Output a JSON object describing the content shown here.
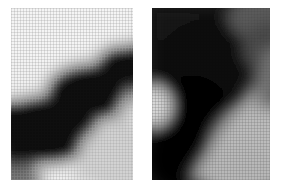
{
  "figure": {
    "background_color": "#ffffff",
    "canvas_width": 284,
    "canvas_height": 188,
    "panel_count": 2
  },
  "panels": [
    {
      "id": "panel-left",
      "name": "left-grayscale-panel",
      "x": 11,
      "y": 8,
      "width": 122,
      "height": 172,
      "grid_visible": true,
      "grid_spacing_px": 3,
      "grid_tone": "light",
      "overall_tone": "light background with dark diagonal band",
      "min_gray": "#050505",
      "max_gray": "#f4f4f4",
      "regions": [
        {
          "name": "upper-left-bright-field",
          "tone": "#ededed"
        },
        {
          "name": "diagonal-dark-band",
          "tone": "#0a0a0a"
        },
        {
          "name": "lower-right-midtone",
          "tone": "#c8c8c8"
        },
        {
          "name": "left-edge-gradient",
          "tone": "#9a9a9a"
        },
        {
          "name": "bottom-left-dark-lobe",
          "tone": "#141414"
        }
      ]
    },
    {
      "id": "panel-right",
      "name": "right-grayscale-panel",
      "x": 152,
      "y": 8,
      "width": 118,
      "height": 172,
      "grid_visible": true,
      "grid_spacing_px": 3,
      "grid_tone": "dark",
      "overall_tone": "dark upper field with light lower-right region",
      "min_gray": "#030303",
      "max_gray": "#d8d8d8",
      "regions": [
        {
          "name": "upper-dark-field",
          "tone": "#1a1a1a"
        },
        {
          "name": "left-edge-highlight",
          "tone": "#c4c4c4"
        },
        {
          "name": "central-black-mass",
          "tone": "#060606"
        },
        {
          "name": "lower-right-light-field",
          "tone": "#b0b0b0"
        },
        {
          "name": "right-edge-midtone",
          "tone": "#6a6a6a"
        }
      ]
    }
  ],
  "gap": {
    "name": "inter-panel-gap",
    "x": 133,
    "width": 19,
    "color": "#ffffff"
  },
  "chart_data": {
    "type": "heatmap",
    "title": "",
    "xlabel": "",
    "ylabel": "",
    "colormap": "grayscale",
    "value_range": [
      0,
      255
    ],
    "panels": [
      {
        "label": "left",
        "nx": 12,
        "ny": 17,
        "values": [
          [
            236,
            240,
            243,
            245,
            246,
            246,
            245,
            244,
            242,
            240,
            238,
            236
          ],
          [
            228,
            236,
            241,
            244,
            246,
            246,
            245,
            243,
            240,
            236,
            232,
            228
          ],
          [
            216,
            228,
            238,
            243,
            245,
            245,
            243,
            238,
            231,
            222,
            212,
            204
          ],
          [
            198,
            214,
            230,
            240,
            243,
            242,
            236,
            226,
            210,
            190,
            170,
            152
          ],
          [
            172,
            192,
            214,
            231,
            238,
            234,
            220,
            198,
            168,
            136,
            108,
            88
          ],
          [
            140,
            160,
            184,
            206,
            216,
            206,
            180,
            144,
            104,
            70,
            48,
            36
          ],
          [
            104,
            120,
            142,
            160,
            164,
            148,
            116,
            76,
            44,
            24,
            14,
            10
          ],
          [
            72,
            82,
            94,
            100,
            96,
            80,
            56,
            32,
            16,
            9,
            6,
            5
          ],
          [
            44,
            48,
            52,
            52,
            46,
            36,
            24,
            14,
            8,
            5,
            5,
            6
          ],
          [
            26,
            26,
            26,
            24,
            20,
            16,
            11,
            8,
            6,
            6,
            8,
            14
          ],
          [
            16,
            15,
            14,
            13,
            11,
            9,
            8,
            7,
            8,
            12,
            24,
            48
          ],
          [
            12,
            11,
            10,
            10,
            9,
            9,
            9,
            12,
            22,
            44,
            80,
            120
          ],
          [
            11,
            10,
            10,
            10,
            11,
            13,
            20,
            36,
            66,
            104,
            142,
            172
          ],
          [
            12,
            12,
            13,
            16,
            22,
            34,
            56,
            88,
            124,
            156,
            180,
            196
          ],
          [
            18,
            22,
            30,
            44,
            64,
            92,
            124,
            152,
            176,
            194,
            206,
            214
          ],
          [
            40,
            54,
            76,
            102,
            128,
            152,
            172,
            188,
            200,
            210,
            216,
            220
          ],
          [
            84,
            104,
            128,
            150,
            168,
            182,
            194,
            202,
            210,
            216,
            220,
            222
          ]
        ]
      },
      {
        "label": "right",
        "nx": 12,
        "ny": 17,
        "values": [
          [
            44,
            36,
            30,
            26,
            24,
            24,
            26,
            30,
            36,
            48,
            66,
            86
          ],
          [
            40,
            32,
            26,
            22,
            20,
            20,
            22,
            28,
            38,
            54,
            76,
            98
          ],
          [
            36,
            28,
            22,
            18,
            16,
            16,
            20,
            28,
            42,
            64,
            92,
            116
          ],
          [
            36,
            28,
            20,
            16,
            14,
            14,
            18,
            28,
            48,
            76,
            108,
            132
          ],
          [
            44,
            32,
            22,
            16,
            12,
            12,
            16,
            28,
            52,
            84,
            118,
            142
          ],
          [
            64,
            44,
            26,
            16,
            11,
            10,
            14,
            26,
            52,
            88,
            124,
            148
          ],
          [
            100,
            68,
            36,
            18,
            10,
            8,
            11,
            22,
            48,
            86,
            124,
            150
          ],
          [
            140,
            98,
            50,
            22,
            10,
            7,
            9,
            18,
            42,
            80,
            120,
            148
          ],
          [
            164,
            118,
            60,
            24,
            10,
            6,
            8,
            15,
            36,
            72,
            114,
            144
          ],
          [
            152,
            110,
            56,
            22,
            9,
            6,
            7,
            14,
            34,
            70,
            112,
            142
          ],
          [
            118,
            84,
            44,
            18,
            8,
            6,
            8,
            16,
            40,
            80,
            122,
            150
          ],
          [
            76,
            54,
            30,
            14,
            8,
            7,
            12,
            28,
            62,
            104,
            142,
            164
          ],
          [
            44,
            32,
            20,
            12,
            9,
            12,
            26,
            56,
            98,
            136,
            164,
            178
          ],
          [
            26,
            20,
            14,
            11,
            12,
            24,
            52,
            94,
            132,
            160,
            178,
            188
          ],
          [
            16,
            13,
            11,
            11,
            18,
            42,
            80,
            120,
            152,
            172,
            184,
            190
          ],
          [
            11,
            10,
            10,
            14,
            30,
            64,
            104,
            138,
            162,
            178,
            188,
            192
          ],
          [
            9,
            9,
            12,
            22,
            46,
            84,
            120,
            148,
            168,
            182,
            190,
            194
          ]
        ]
      }
    ]
  }
}
